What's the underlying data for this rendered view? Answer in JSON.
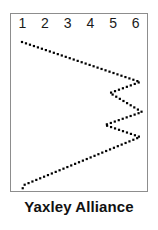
{
  "caption": {
    "label": "Yaxley Alliance"
  },
  "chart_data": {
    "type": "line",
    "title": "Yaxley Alliance",
    "xlabel": "",
    "ylabel": "",
    "grid": false,
    "legend": "none",
    "marker": "square-dot",
    "line_style": "dotted",
    "series_color": "#000000",
    "column_headers": [
      "1",
      "2",
      "3",
      "4",
      "5",
      "6"
    ],
    "xlim": [
      1,
      6
    ],
    "ylim": [
      0,
      1
    ],
    "note": "Dotted polyline traced left-to-right then zig-zagging, plotted in column-index units (x) versus vertical pixel position normalised 0 (top) to 1 (bottom).",
    "vertices": [
      {
        "x": 1.05,
        "y": 0.16
      },
      {
        "x": 5.95,
        "y": 0.39
      },
      {
        "x": 4.7,
        "y": 0.45
      },
      {
        "x": 6.05,
        "y": 0.56
      },
      {
        "x": 4.5,
        "y": 0.63
      },
      {
        "x": 5.9,
        "y": 0.7
      },
      {
        "x": 1.15,
        "y": 0.96
      },
      {
        "x": 1.02,
        "y": 1.0
      }
    ],
    "pixel_points": [
      [
        22,
        42
      ],
      [
        140,
        82
      ],
      [
        110,
        93
      ],
      [
        142,
        112
      ],
      [
        105,
        125
      ],
      [
        140,
        137
      ],
      [
        24,
        185
      ],
      [
        22,
        190
      ]
    ]
  },
  "frame": {
    "border_color": "#8d8d8d",
    "background": "#ffffff"
  }
}
